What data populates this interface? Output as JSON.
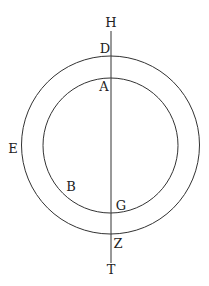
{
  "diagram": {
    "stroke_color": "#333333",
    "background": "#ffffff",
    "outer_circle": {
      "cx": 110.5,
      "cy": 145,
      "r": 89
    },
    "inner_circle": {
      "cx": 110.5,
      "cy": 145.5,
      "r": 67.5
    },
    "vertical_line": {
      "x1": 111,
      "y1": 31,
      "x2": 111,
      "y2": 263
    },
    "labels": {
      "H": "H",
      "D": "D",
      "A": "A",
      "E": "E",
      "B": "B",
      "G": "G",
      "Z": "Z",
      "T": "T"
    }
  }
}
